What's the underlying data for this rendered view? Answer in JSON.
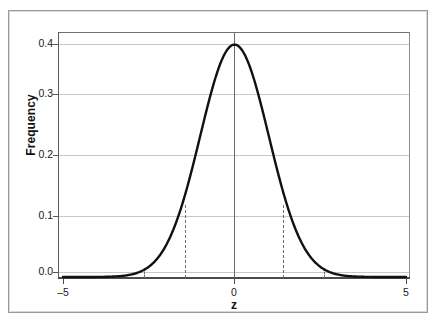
{
  "chart_data": {
    "type": "line",
    "title": "",
    "subtitle": "",
    "xlabel": "z",
    "ylabel": "Frequency",
    "xlim": [
      -5,
      5
    ],
    "ylim": [
      0.0,
      0.41
    ],
    "grid": "horizontal",
    "legend": "none",
    "x_ticks": [
      {
        "value": -5,
        "label": "–5"
      },
      {
        "value": 0,
        "label": "0"
      },
      {
        "value": 5,
        "label": "5"
      }
    ],
    "y_ticks": [
      {
        "value": 0.0,
        "label": "0.0"
      },
      {
        "value": 0.1,
        "label": "0.1"
      },
      {
        "value": 0.2,
        "label": "0.2"
      },
      {
        "value": 0.3,
        "label": "0.3"
      },
      {
        "value": 0.4,
        "label": "0.4"
      }
    ],
    "series": [
      {
        "name": "standard normal density",
        "x": [
          -5.0,
          -4.75,
          -4.5,
          -4.25,
          -4.0,
          -3.75,
          -3.5,
          -3.25,
          -3.0,
          -2.75,
          -2.5,
          -2.25,
          -2.0,
          -1.75,
          -1.5,
          -1.25,
          -1.0,
          -0.75,
          -0.5,
          -0.25,
          0.0,
          0.25,
          0.5,
          0.75,
          1.0,
          1.25,
          1.5,
          1.75,
          2.0,
          2.25,
          2.5,
          2.75,
          3.0,
          3.25,
          3.5,
          3.75,
          4.0,
          4.25,
          4.5,
          4.75,
          5.0
        ],
        "y": [
          1.5e-06,
          6.3e-06,
          1.6e-05,
          4.27e-05,
          0.0001338,
          0.0003817,
          0.0008727,
          0.0020308,
          0.0044318,
          0.0090936,
          0.0175283,
          0.0317017,
          0.053991,
          0.0862773,
          0.1295176,
          0.1826491,
          0.2419707,
          0.3011374,
          0.3520653,
          0.3866681,
          0.3989423,
          0.3866681,
          0.3520653,
          0.3011374,
          0.2419707,
          0.1826491,
          0.1295176,
          0.0862773,
          0.053991,
          0.0317017,
          0.0175283,
          0.0090936,
          0.0044318,
          0.0020308,
          0.0008727,
          0.0003817,
          0.0001338,
          4.27e-05,
          1.6e-05,
          6.3e-06,
          1.5e-06
        ]
      }
    ],
    "annotations": [
      {
        "name": "center-line",
        "type": "vline",
        "x": 0.0,
        "style": "solid",
        "y_top": 0.41,
        "y_bottom": 0.0
      },
      {
        "name": "inner-reference-line-left",
        "type": "vline",
        "x": -1.4,
        "style": "dashed",
        "y_top": 0.1497,
        "y_bottom": 0.0
      },
      {
        "name": "inner-reference-line-right",
        "type": "vline",
        "x": 1.4,
        "style": "dashed",
        "y_top": 0.1497,
        "y_bottom": 0.0
      },
      {
        "name": "outer-reference-line-left",
        "type": "vline",
        "x": -2.55,
        "style": "dashed",
        "y_top": 0.0155,
        "y_bottom": 0.0
      },
      {
        "name": "outer-reference-line-right",
        "type": "vline",
        "x": 2.55,
        "style": "dashed",
        "y_top": 0.0155,
        "y_bottom": 0.0
      }
    ],
    "colors": {
      "curve": "#111111",
      "gridline": "#c8c8c8",
      "axis": "#4a4a4a",
      "reference_line": "#6f6f6f",
      "frame": "#9a9a9a",
      "background": "#ffffff"
    }
  }
}
